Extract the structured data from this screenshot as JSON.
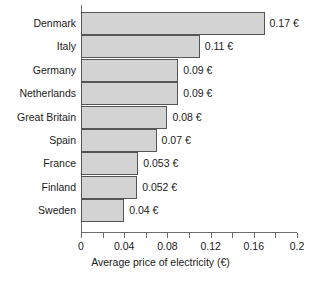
{
  "chart_data": {
    "type": "bar",
    "orientation": "horizontal",
    "title": "",
    "xlabel": "Average price of electricity (€)",
    "ylabel": "",
    "xlim": [
      0,
      0.2
    ],
    "xticks": [
      0,
      0.02,
      0.04,
      0.06,
      0.08,
      0.1,
      0.12,
      0.14,
      0.16,
      0.18,
      0.2
    ],
    "xtick_labels": [
      "0",
      "",
      "0.04",
      "",
      "0.08",
      "",
      "0.12",
      "",
      "0.16",
      "",
      "0.2"
    ],
    "grid": false,
    "legend": null,
    "bar_fill_color": "#d3d3d3",
    "bar_edge_color": "#555555",
    "axis_color": "#6b6b6b",
    "categories": [
      "Denmark",
      "Italy",
      "Germany",
      "Netherlands",
      "Great Britain",
      "Spain",
      "France",
      "Finland",
      "Sweden"
    ],
    "values": [
      0.17,
      0.11,
      0.09,
      0.09,
      0.08,
      0.07,
      0.053,
      0.052,
      0.04
    ],
    "data_labels": [
      "0.17 €",
      "0.11 €",
      "0.09 €",
      "0.09 €",
      "0.08 €",
      "0.07 €",
      "0.053 €",
      "0.052 €",
      "0.04 €"
    ]
  }
}
